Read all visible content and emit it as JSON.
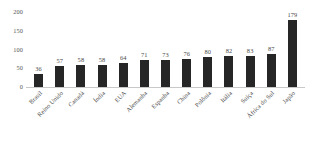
{
  "chart_data": {
    "type": "bar",
    "title": "",
    "subtitle": "",
    "xlabel": "",
    "ylabel": "",
    "orientation": "vertical",
    "grid": false,
    "legend": false,
    "legend_position": "none",
    "bar_color": "#262626",
    "axis_color": "#c8c8c8",
    "label_color": "#4b4b4b",
    "ylim": [
      0,
      200
    ],
    "yticks": [
      0,
      50,
      100,
      150,
      200
    ],
    "ytick_labels": [
      "0",
      "50",
      "100",
      "150",
      "200"
    ],
    "categories": [
      "Brasil",
      "Reino Unido",
      "Canadá",
      "Índia",
      "EUA",
      "Alemanha",
      "Espanha",
      "China",
      "Polônia",
      "Itália",
      "Suíça",
      "África do Sul",
      "Japão"
    ],
    "values": [
      36,
      57,
      58,
      58,
      64,
      71,
      73,
      76,
      80,
      82,
      83,
      87,
      179
    ],
    "value_labels": [
      "36",
      "57",
      "58",
      "58",
      "64",
      "71",
      "73",
      "76",
      "80",
      "82",
      "83",
      "87",
      "179"
    ],
    "show_value_labels": true,
    "xtick_rotation": -45
  }
}
